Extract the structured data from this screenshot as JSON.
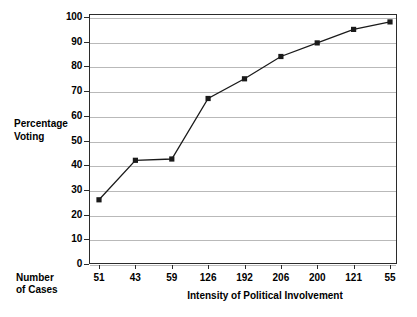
{
  "chart_data": {
    "type": "line",
    "title": "",
    "xlabel": "Intensity of Political Involvement",
    "ylabel": "Percentage Voting",
    "ylim": [
      0,
      100
    ],
    "ytick_step": 10,
    "grid": true,
    "legend": "none",
    "marker": "filled-square",
    "line_color": "#1a1a1a",
    "grid_color": "#b9b9b9",
    "frame_color": "#2b2b2b",
    "categories": [
      "51",
      "43",
      "59",
      "126",
      "192",
      "206",
      "200",
      "121",
      "55"
    ],
    "category_axis_label": "Number of Cases",
    "category_axis_label_lines": [
      "Number",
      "of Cases"
    ],
    "values": [
      26,
      42,
      42.5,
      67,
      75,
      84,
      89.5,
      95,
      98
    ],
    "yticks": [
      {
        "label": "100",
        "value": 100
      },
      {
        "label": "90",
        "value": 90
      },
      {
        "label": "80",
        "value": 80
      },
      {
        "label": "70",
        "value": 70
      },
      {
        "label": "60",
        "value": 60
      },
      {
        "label": "50",
        "value": 50
      },
      {
        "label": "40",
        "value": 40
      },
      {
        "label": "30",
        "value": 30
      },
      {
        "label": "20",
        "value": 20
      },
      {
        "label": "10",
        "value": 10
      },
      {
        "label": "0",
        "value": 0
      }
    ],
    "ylabel_lines": [
      "Percentage",
      "Voting"
    ]
  }
}
